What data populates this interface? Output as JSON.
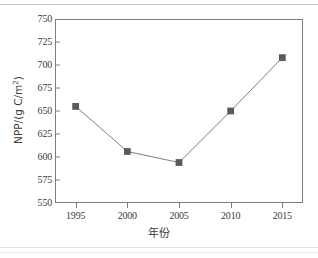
{
  "figure": {
    "background_color": "#ffffff",
    "frame_color": "#7d7d7d",
    "series_color": "#5a5a5a",
    "text_color": "#3b3b3b"
  },
  "chart_data": {
    "type": "line",
    "title": "",
    "subtitle": "",
    "xlabel": "年份",
    "ylabel": "NPP/(g C/m",
    "ylabel_superscript": "2",
    "ylabel_suffix": ")",
    "categories": [
      1995,
      2000,
      2005,
      2010,
      2015
    ],
    "x": [
      1995,
      2000,
      2005,
      2010,
      2015
    ],
    "values": [
      655,
      606,
      594,
      650,
      708
    ],
    "series": [
      {
        "name": "NPP",
        "values": [
          655,
          606,
          594,
          650,
          708
        ],
        "marker": "square",
        "marker_color": "#5a5a5a",
        "line_color": "#808080"
      }
    ],
    "xlim": [
      1993,
      2017
    ],
    "ylim": [
      550,
      750
    ],
    "xticks": [
      1995,
      2000,
      2005,
      2010,
      2015
    ],
    "xtick_labels": [
      "1995",
      "2000",
      "2005",
      "2010",
      "2015"
    ],
    "yticks": [
      550,
      575,
      600,
      625,
      650,
      675,
      700,
      725,
      750
    ],
    "ytick_labels": [
      "550",
      "575",
      "600",
      "625",
      "650",
      "675",
      "700",
      "725",
      "750"
    ],
    "grid": false,
    "legend": null,
    "legend_position": "none",
    "annotations": []
  }
}
